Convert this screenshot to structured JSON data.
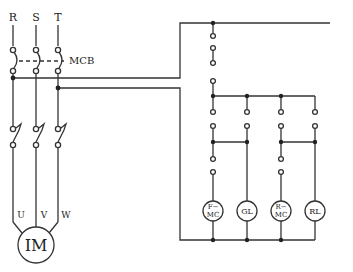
{
  "diagram": {
    "type": "motor control wiring diagram",
    "power_circuit": {
      "phase_labels": [
        "R",
        "S",
        "T"
      ],
      "breaker_label": "MCB",
      "motor_terminals": [
        "U",
        "V",
        "W"
      ],
      "motor_label": "IM"
    },
    "control_circuit": {
      "loads": [
        {
          "id": "fmc",
          "line1": "F−",
          "line2": "MC"
        },
        {
          "id": "gl",
          "line1": "GL",
          "line2": ""
        },
        {
          "id": "rmc",
          "line1": "R−",
          "line2": "MC"
        },
        {
          "id": "rl",
          "line1": "RL",
          "line2": ""
        }
      ]
    },
    "colors": {
      "line": "#333333",
      "background": "#ffffff"
    }
  }
}
